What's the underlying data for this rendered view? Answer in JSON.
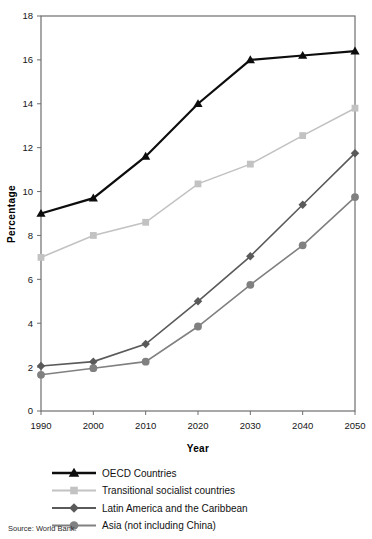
{
  "chart_data": {
    "type": "line",
    "title": "",
    "xlabel": "Year",
    "ylabel": "Percentage",
    "x": [
      1990,
      2000,
      2010,
      2020,
      2030,
      2040,
      2050
    ],
    "xticklabels": [
      "1990",
      "2000",
      "2010",
      "2020",
      "2030",
      "2040",
      "2050"
    ],
    "yticklabels": [
      "0",
      "2",
      "4",
      "6",
      "8",
      "10",
      "12",
      "14",
      "16",
      "18"
    ],
    "yticks": [
      0,
      2,
      4,
      6,
      8,
      10,
      12,
      14,
      16,
      18
    ],
    "xlim": [
      1990,
      2050
    ],
    "ylim": [
      0,
      18
    ],
    "grid": false,
    "legend_position": "below-plot-left",
    "series": [
      {
        "name": "OECD Countries",
        "marker": "triangle",
        "color": "#0d0d0d",
        "values": [
          9.0,
          9.7,
          11.6,
          14.0,
          16.0,
          16.2,
          16.4
        ]
      },
      {
        "name": "Transitional socialist countries",
        "marker": "square",
        "color": "#c2c2c2",
        "values": [
          7.0,
          8.0,
          8.6,
          10.35,
          11.25,
          12.55,
          13.8
        ]
      },
      {
        "name": "Latin America and the Caribbean",
        "marker": "diamond",
        "color": "#5a5a5a",
        "values": [
          2.05,
          2.25,
          3.05,
          5.0,
          7.05,
          9.4,
          11.75
        ]
      },
      {
        "name": "Asia (not including China)",
        "marker": "circle",
        "color": "#808080",
        "values": [
          1.65,
          1.95,
          2.25,
          3.85,
          5.75,
          7.55,
          9.75
        ]
      }
    ],
    "source": "Source: World Bank."
  },
  "legend": {
    "items": [
      {
        "label": "OECD Countries",
        "marker": "triangle",
        "color": "#0d0d0d"
      },
      {
        "label": "Transitional socialist countries",
        "marker": "square",
        "color": "#c2c2c2"
      },
      {
        "label": "Latin America and the Caribbean",
        "marker": "diamond",
        "color": "#5a5a5a"
      },
      {
        "label": "Asia (not including China)",
        "marker": "circle",
        "color": "#808080"
      }
    ]
  },
  "axes": {
    "y_title": "Percentage",
    "x_title": "Year"
  },
  "footer": {
    "source": "Source: World Bank."
  }
}
